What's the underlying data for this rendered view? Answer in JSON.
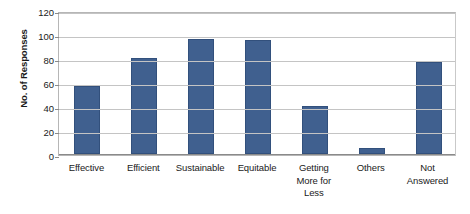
{
  "chart_data": {
    "type": "bar",
    "title": "",
    "xlabel": "",
    "ylabel": "No. of Responses",
    "ylim": [
      0,
      120
    ],
    "yticks": [
      0,
      20,
      40,
      60,
      80,
      100,
      120
    ],
    "grid": true,
    "legend": false,
    "bar_color": "#40608f",
    "bar_border_color": "#32507c",
    "gridline_color": "#c4c4c4",
    "plot_border_color": "#b6b6b6",
    "background_color": "#ffffff",
    "categories": [
      "Effective",
      "Efficient",
      "Sustainable",
      "Equitable",
      "Getting More for Less",
      "Others",
      "Not Answered"
    ],
    "category_label_lines": [
      [
        "Effective"
      ],
      [
        "Efficient"
      ],
      [
        "Sustainable"
      ],
      [
        "Equitable"
      ],
      [
        "Getting",
        "More for",
        "Less"
      ],
      [
        "Others"
      ],
      [
        "Not",
        "Answered"
      ]
    ],
    "values": [
      57,
      80,
      96,
      95,
      40,
      5,
      77
    ]
  }
}
